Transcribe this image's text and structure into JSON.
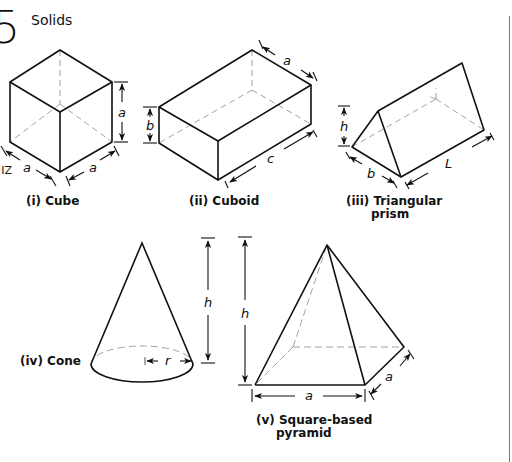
{
  "header": {
    "chapter_number": "5",
    "section_title": "Solids"
  },
  "diagram": {
    "type": "solid-geometry-reference",
    "solids": [
      {
        "id": "cube",
        "caption": "(i) Cube",
        "dimensions": [
          "a",
          "a",
          "a"
        ]
      },
      {
        "id": "cuboid",
        "caption": "(ii) Cuboid",
        "dimensions": [
          "a",
          "b",
          "c"
        ]
      },
      {
        "id": "triangular-prism",
        "caption_line1": "(iii) Triangular",
        "caption_line2": "prism",
        "dimensions": [
          "h",
          "b",
          "L"
        ]
      },
      {
        "id": "cone",
        "caption": "(iv) Cone",
        "dimensions": [
          "h",
          "r"
        ]
      },
      {
        "id": "square-pyramid",
        "caption_line1": "(v) Square-based",
        "caption_line2": "pyramid",
        "dimensions": [
          "h",
          "a",
          "a"
        ]
      }
    ],
    "labels": {
      "cube_height": "a",
      "cube_left": "a",
      "cube_right": "a",
      "cuboid_width": "a",
      "cuboid_height": "b",
      "cuboid_length": "c",
      "prism_height": "h",
      "prism_base": "b",
      "prism_length": "L",
      "cone_height": "h",
      "cone_radius": "r",
      "pyramid_height": "h",
      "pyramid_base_front": "a",
      "pyramid_base_side": "a"
    },
    "margin_fragment": "ZI"
  },
  "colors": {
    "ink": "#111111",
    "hidden_line": "#8a8a8a",
    "rule": "#777777"
  }
}
